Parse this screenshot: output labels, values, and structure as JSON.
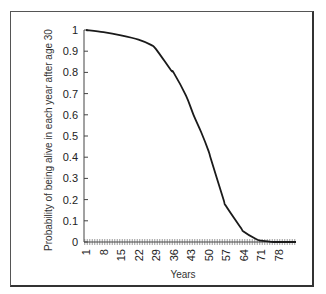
{
  "chart_data": {
    "type": "line",
    "title": "",
    "xlabel": "Years",
    "ylabel": "Probability of being alive in each year after age 30",
    "ylim": [
      0,
      1
    ],
    "xlim": [
      1,
      85
    ],
    "y_ticks": [
      "0",
      "0.1",
      "0.2",
      "0.3",
      "0.4",
      "0.5",
      "0.6",
      "0.7",
      "0.8",
      "0.9",
      "1"
    ],
    "x_tick_labels": [
      "1",
      "8",
      "15",
      "22",
      "29",
      "36",
      "43",
      "50",
      "57",
      "64",
      "71",
      "78"
    ],
    "grid": false,
    "legend": null,
    "series": [
      {
        "name": "Survival probability",
        "x": [
          1,
          8,
          15,
          22,
          27,
          29,
          35,
          36,
          41,
          44,
          47,
          50,
          51,
          56,
          57,
          63,
          64,
          69,
          71,
          75,
          78,
          85
        ],
        "values": [
          1.0,
          0.99,
          0.975,
          0.955,
          0.93,
          0.91,
          0.81,
          0.8,
          0.69,
          0.6,
          0.52,
          0.43,
          0.39,
          0.2,
          0.17,
          0.066,
          0.05,
          0.014,
          0.006,
          0.001,
          0.0,
          0.0
        ]
      }
    ]
  }
}
